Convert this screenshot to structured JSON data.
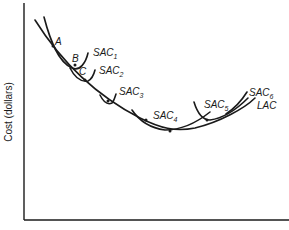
{
  "diagram": {
    "y_axis_label": "Cost (dollars)",
    "x_axis_label": "",
    "points": [
      {
        "label": "A"
      },
      {
        "label": "B"
      },
      {
        "label": "C"
      }
    ],
    "curves": [
      {
        "name": "SAC",
        "sub": "1"
      },
      {
        "name": "SAC",
        "sub": "2"
      },
      {
        "name": "SAC",
        "sub": "3"
      },
      {
        "name": "SAC",
        "sub": "4"
      },
      {
        "name": "SAC",
        "sub": "5"
      },
      {
        "name": "SAC",
        "sub": "6"
      },
      {
        "name": "LAC",
        "sub": ""
      }
    ]
  }
}
